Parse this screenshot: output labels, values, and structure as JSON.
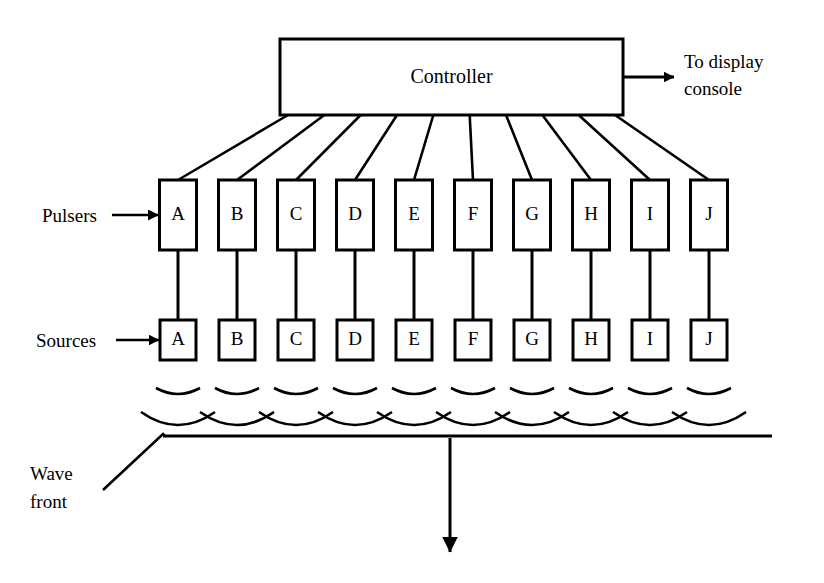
{
  "diagram": {
    "controller": {
      "label": "Controller",
      "box": {
        "x": 280,
        "y": 39,
        "w": 343,
        "h": 76
      }
    },
    "output": {
      "label_line1": "To display",
      "label_line2": "console",
      "arrow_from_x": 623,
      "arrow_to_x": 674,
      "arrow_y": 77,
      "text_x": 684,
      "text_y1": 68,
      "text_y2": 95
    },
    "row_labels": {
      "pulsers": "Pulsers",
      "sources": "Sources",
      "wave_front_line1": "Wave",
      "wave_front_line2": "front"
    },
    "channels": [
      "A",
      "B",
      "C",
      "D",
      "E",
      "F",
      "G",
      "H",
      "I",
      "J"
    ],
    "geometry": {
      "first_col_center_x": 178,
      "col_pitch": 59,
      "pulser_box": {
        "w": 37,
        "h": 70,
        "top": 180
      },
      "source_box": {
        "w": 36,
        "h": 40,
        "top": 320
      },
      "arc_row_upper_y": 388,
      "arc_row_lower_y": 412,
      "wavefront_line_y": 436,
      "wavefront_line_x1": 163,
      "wavefront_line_x2": 772,
      "propagation_arrow_x": 450,
      "propagation_arrow_y1": 438,
      "propagation_arrow_y2": 552
    },
    "colors": {
      "ink": "#000000",
      "paper": "#ffffff"
    }
  }
}
